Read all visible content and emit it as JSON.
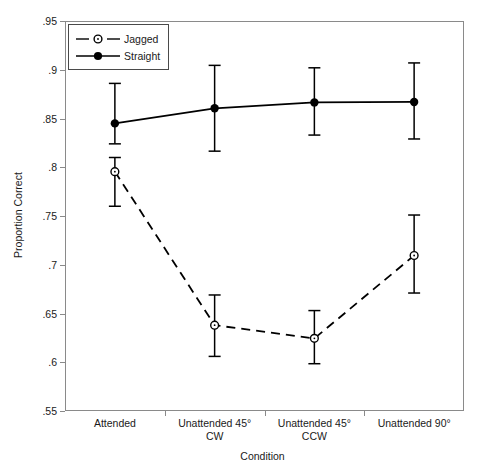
{
  "chart_data": {
    "type": "line",
    "title": "",
    "xlabel": "Condition",
    "ylabel": "Proportion Correct",
    "categories": [
      "Attended",
      "Unattended 45°\nCW",
      "Unattended 45°\nCCW",
      "Unattended 90°"
    ],
    "category_labels": [
      {
        "line1": "Attended",
        "line2": ""
      },
      {
        "line1": "Unattended 45°",
        "line2": "CW"
      },
      {
        "line1": "Unattended 45°",
        "line2": "CCW"
      },
      {
        "line1": "Unattended 90°",
        "line2": ""
      }
    ],
    "ylim": [
      0.55,
      0.95
    ],
    "yticks": [
      0.95,
      0.9,
      0.85,
      0.8,
      0.75,
      0.7,
      0.65,
      0.6,
      0.55
    ],
    "ytick_labels": [
      ".95",
      ".9",
      ".85",
      ".8",
      ".75",
      ".7",
      ".65",
      ".6",
      ".55"
    ],
    "grid": false,
    "legend_position": "top-left",
    "series": [
      {
        "name": "Jagged",
        "marker": "open-circle",
        "line_style": "dashed",
        "color": "#000000",
        "values": [
          0.7955,
          0.638,
          0.6245,
          0.7095
        ],
        "err_low": [
          0.76,
          0.606,
          0.5985,
          0.671
        ],
        "err_high": [
          0.81,
          0.669,
          0.653,
          0.751
        ]
      },
      {
        "name": "Straight",
        "marker": "filled-circle",
        "line_style": "solid",
        "color": "#000000",
        "values": [
          0.845,
          0.8605,
          0.8665,
          0.867
        ],
        "err_low": [
          0.824,
          0.8165,
          0.833,
          0.829
        ],
        "err_high": [
          0.886,
          0.9045,
          0.902,
          0.907
        ]
      }
    ]
  },
  "legend": {
    "items": [
      {
        "label": "Jagged"
      },
      {
        "label": "Straight"
      }
    ]
  }
}
